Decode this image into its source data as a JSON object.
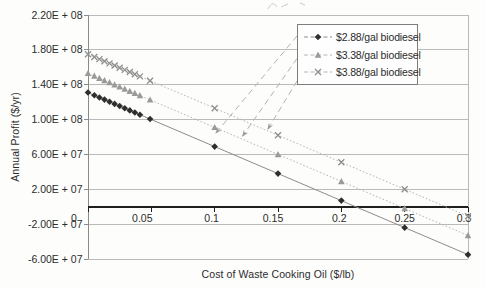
{
  "chart_data": {
    "type": "line",
    "title": "",
    "xlabel": "Cost of Waste Cooking Oil ($/lb)",
    "ylabel": "Annual Profit ($/yr)",
    "xlim": [
      0,
      0.3
    ],
    "ylim": [
      -60000000,
      220000000
    ],
    "grid": "horizontal",
    "legend_position": "top-right-inside",
    "x_ticks": [
      0,
      0.05,
      0.1,
      0.15,
      0.2,
      0.25,
      0.3
    ],
    "x_tick_labels": [
      "0",
      "0.05",
      "0.1",
      "0.15",
      "0.2",
      "0.25",
      "0.3"
    ],
    "y_ticks": [
      220000000,
      180000000,
      140000000,
      100000000,
      60000000,
      20000000,
      -20000000,
      -60000000
    ],
    "y_tick_labels": [
      "2.20E + 08",
      "1.80E + 08",
      "1.40E + 08",
      "1.00E + 08",
      "6.00E + 07",
      "2.00E + 07",
      "-2.00E + 07",
      "-6.00E + 07"
    ],
    "x": [
      0,
      0.005,
      0.009,
      0.013,
      0.017,
      0.021,
      0.025,
      0.029,
      0.033,
      0.037,
      0.041,
      0.049,
      0.1,
      0.15,
      0.2,
      0.25,
      0.3
    ],
    "series": [
      {
        "name": "$2.88/gal biodiesel",
        "marker": "diamond",
        "marker_color": "#2f2f2f",
        "line_color": "#8c8c8c",
        "line_dash": "",
        "values": [
          131000000,
          127900000,
          125400000,
          122900000,
          120500000,
          118000000,
          115500000,
          113000000,
          110500000,
          108100000,
          105600000,
          100600000,
          69000000,
          38000000,
          7000000,
          -24000000,
          -55000000
        ]
      },
      {
        "name": "$3.38/gal biodiesel",
        "marker": "triangle",
        "marker_color": "#9a9a9a",
        "line_color": "#b6b6b6",
        "line_dash": "1.6 2",
        "values": [
          153000000,
          149900000,
          147400000,
          144900000,
          142500000,
          140000000,
          137500000,
          135000000,
          132500000,
          130100000,
          127600000,
          122600000,
          91000000,
          60000000,
          29000000,
          -2000000,
          -33000000
        ]
      },
      {
        "name": "$3.88/gal biodiesel",
        "marker": "x",
        "marker_color": "#8e8e8e",
        "line_color": "#b6b6b6",
        "line_dash": "1.6 2",
        "values": [
          175000000,
          171900000,
          169400000,
          166900000,
          164500000,
          162000000,
          159500000,
          157000000,
          154500000,
          152100000,
          149600000,
          144600000,
          113000000,
          82000000,
          51000000,
          20000000,
          -11000000
        ]
      }
    ],
    "annotations": {
      "legend_callouts": [
        {
          "legend_index": 0,
          "tip_x": 0.101,
          "tip_y": 84500000
        },
        {
          "legend_index": 1,
          "tip_x": 0.122,
          "tip_y": 81000000
        },
        {
          "legend_index": 2,
          "tip_x": 0.142,
          "tip_y": 89000000
        }
      ]
    },
    "colors": {
      "gridline": "#b3b3b3",
      "plot_border": "#b3b3b3",
      "value_axis": "#8a8a8a",
      "zero_axis": "#1f1f1f",
      "callout": "#b2b2b2",
      "text": "#2b2b2b"
    }
  }
}
